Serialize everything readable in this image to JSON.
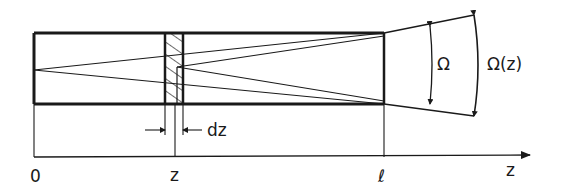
{
  "diagram": {
    "title": "",
    "labels": {
      "origin": "0",
      "z_position": "z",
      "length": "ℓ",
      "axis": "z",
      "slice_width": "dz",
      "solid_angle": "Ω",
      "solid_angle_z": "Ω(z)"
    },
    "colors": {
      "ink": "#1a1a1a",
      "background": "#ffffff"
    },
    "elements": [
      {
        "id": "rod",
        "type": "rectangle",
        "description": "Long rod/cylinder from 0 to ℓ"
      },
      {
        "id": "slice",
        "type": "hatched-rectangle",
        "description": "Thin slice of thickness dz at position z"
      },
      {
        "id": "rays-from-origin",
        "type": "lines",
        "description": "Rays from left end fanning to right end aperture"
      },
      {
        "id": "rays-from-slice",
        "type": "lines",
        "description": "Rays from slice at z fanning to right end"
      },
      {
        "id": "omega-arc",
        "type": "arc-arrow",
        "description": "Solid angle Ω subtended at right end"
      },
      {
        "id": "omega-z-arc",
        "type": "arc-arrow",
        "description": "Solid angle Ω(z) subtended from slice"
      },
      {
        "id": "z-axis",
        "type": "axis-arrow",
        "description": "z axis from 0 to beyond ℓ"
      }
    ]
  }
}
